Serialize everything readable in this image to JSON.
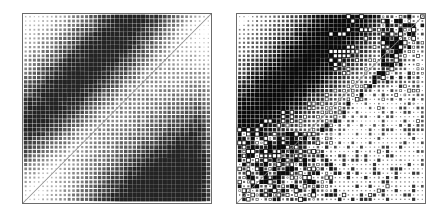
{
  "figure": {
    "background_color": "#ffffff",
    "width": 441,
    "height": 217,
    "type": "two-panel matrix visualization"
  },
  "panels": [
    {
      "id": "left",
      "name": "left-matrix-panel",
      "title": "",
      "frame_color": "#6b6b6b",
      "x": 22,
      "y": 13,
      "width": 190,
      "height": 191,
      "grid_n": 43,
      "marker_shape": "square",
      "marker_fill": "#3a3a3a",
      "marker_open": false,
      "diagonal_line": true,
      "diagonal_color": "#8a8a8a",
      "description": "Dense regular grid of gray squares whose size encodes magnitude; smooth block structure with an anti-diagonal band in the upper-left and a broad dark triangular region in the lower-right above the main diagonal."
    },
    {
      "id": "right",
      "name": "right-matrix-panel",
      "title": "",
      "frame_color": "#6b6b6b",
      "x": 236,
      "y": 13,
      "width": 190,
      "height": 191,
      "grid_n": 43,
      "marker_shape": "square",
      "marker_fill": "#1d1d1d",
      "marker_open": true,
      "diagonal_line": true,
      "diagonal_color": "#8a8a8a",
      "description": "Same underlying block structure as left panel but with sparse, high-contrast scatter: large filled black squares and hollow open squares (negative values) clustered near the main diagonal and in the upper-right / lower-left corners."
    }
  ],
  "chart_data": {
    "type": "heatmap",
    "title": "",
    "subtitle": "",
    "xlabel": "",
    "ylabel": "",
    "grid": false,
    "legend": "none",
    "n_rows": 43,
    "n_cols": 43,
    "xlim": [
      0,
      43
    ],
    "ylim": [
      0,
      43
    ],
    "axis_ticks_visible": false,
    "annotations": [
      "main diagonal line drawn from bottom-left to top-right in both panels"
    ],
    "series": [
      {
        "name": "panel-left",
        "encoding": "square marker area proportional to |value|, all values positive (filled gray)",
        "value_range": [
          0,
          1
        ],
        "structure": {
          "upper_left_band": "dense strong values along an anti-diagonal band from top-left, decaying outward",
          "lower_right_block": "broad dark triangle of strong values between the main diagonal and the right edge",
          "below_diagonal": "near-zero values (tiny markers) in the lower-left triangle",
          "faint_background": "uniform very small markers everywhere else"
        }
      },
      {
        "name": "panel-right",
        "encoding": "square marker area proportional to |value|; filled = positive, hollow = negative",
        "value_range": [
          -1,
          1
        ],
        "structure": {
          "upper_left_band": "same anti-diagonal band as left panel",
          "diagonal_scatter": "strong isolated positive and negative markers hugging the main diagonal",
          "upper_right_cluster": "arc of large filled and hollow markers near the top-right",
          "lower_left_cluster": "arc of large filled and hollow markers near the bottom-left",
          "right_block": "broad dark block of positive values on the right half"
        }
      }
    ]
  }
}
